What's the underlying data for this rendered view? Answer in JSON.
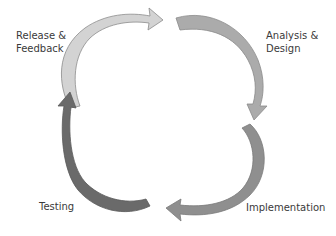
{
  "diagram": {
    "type": "cycle",
    "stages": [
      {
        "id": "release",
        "lines": [
          "Release &",
          "Feedback"
        ],
        "color": "#d3d3d3",
        "stroke": "#8c8c8c",
        "arrow_direction": "right"
      },
      {
        "id": "analysis",
        "lines": [
          "Analysis &",
          "Design"
        ],
        "color": "#ababab",
        "stroke": "#8a8a8a",
        "arrow_direction": "down"
      },
      {
        "id": "implementation",
        "lines": [
          "Implementation"
        ],
        "color": "#8f8f8f",
        "stroke": "#7a7a7a",
        "arrow_direction": "left"
      },
      {
        "id": "testing",
        "lines": [
          "Testing"
        ],
        "color": "#6a6a6a",
        "stroke": "#5a5a5a",
        "arrow_direction": "up"
      }
    ],
    "flow": [
      "release",
      "analysis",
      "implementation",
      "testing",
      "release"
    ]
  }
}
